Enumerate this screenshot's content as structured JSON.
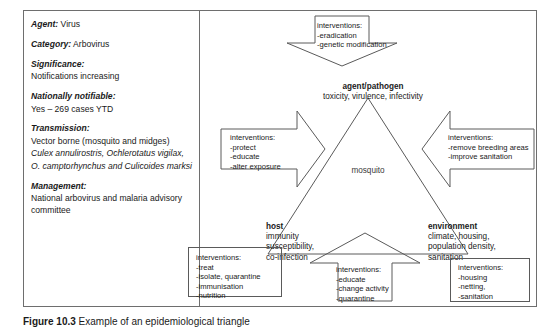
{
  "info_panel": {
    "rows": [
      {
        "label": "Agent:",
        "value": " Virus",
        "inline": true
      },
      {
        "label": "Category:",
        "value": " Arbovirus",
        "inline": true
      },
      {
        "label": "Significance:",
        "value": "Notifications increasing",
        "inline": false
      },
      {
        "label": "Nationally notifiable:",
        "value": "Yes – 269 cases YTD",
        "inline": false
      },
      {
        "label": "Transmission:",
        "value": "Vector borne (mosquito and midges)",
        "value_italic": "Culex annulirostris, Ochlerotatus vigilax, O. camptorhynchus and Culicoides marksi",
        "inline": false
      },
      {
        "label": "Management:",
        "value": "National arbovirus and malaria advisory committee",
        "inline": false
      }
    ],
    "agent_label": "Agent:",
    "agent_value": " Virus",
    "category_label": "Category:",
    "category_value": " Arbovirus",
    "significance_label": "Significance:",
    "significance_value": "Notifications increasing",
    "notifiable_label": "Nationally notifiable:",
    "notifiable_value": "Yes – 269 cases YTD",
    "transmission_label": "Transmission:",
    "transmission_value": "Vector borne (mosquito and midges)",
    "transmission_species": "Culex annulirostris, Ochlerotatus vigilax, O. camptorhynchus and Culicoides marksi",
    "management_label": "Management:",
    "management_value": "National arbovirus and malaria advisory committee"
  },
  "triangle": {
    "center_label": "mosquito",
    "vertices": {
      "agent": {
        "title": "agent/pathogen",
        "subtitle": "toxicity, virulence, infectivity"
      },
      "host": {
        "title": "host",
        "subtitle": "immunity\nsusceptibility,\nco-infection",
        "line1": "immunity",
        "line2": "susceptibility,",
        "line3": "co-infection"
      },
      "environment": {
        "title": "environment",
        "line1": "climate, housing,",
        "line2": "population density,",
        "line3": "sanitation"
      }
    }
  },
  "callouts": {
    "agent_top": {
      "heading": "interventions:",
      "items": [
        "-eradication",
        "-genetic modification"
      ],
      "shape": "arrow-down"
    },
    "host_left": {
      "heading": "interventions:",
      "items": [
        "-protect",
        "-educate",
        "-alter exposure"
      ],
      "shape": "arrow-right"
    },
    "environment_right": {
      "heading": "interventions:",
      "items": [
        "-remove breeding areas",
        "-improve sanitation"
      ],
      "shape": "arrow-left"
    },
    "host_bottom": {
      "heading": "interventions:",
      "items": [
        "-treat",
        "-isolate, quarantine",
        "-immunisation",
        "-nutrition"
      ],
      "shape": "rectangle"
    },
    "center_bottom": {
      "heading": "interventions:",
      "items": [
        "-educate",
        "-change activity",
        "-quarantine"
      ],
      "shape": "arrow-up"
    },
    "environment_bottom": {
      "heading": "interventions:",
      "items": [
        "-housing",
        "-netting,",
        "-sanitation"
      ],
      "shape": "rectangle"
    }
  },
  "caption": {
    "number": "Figure 10.3",
    "text": " Example of an epidemiological triangle"
  },
  "colors": {
    "border": "#6e6e6e",
    "line": "#5a5a5a",
    "text": "#1a1a1a",
    "muted": "#3a3a3a",
    "background": "#ffffff"
  }
}
